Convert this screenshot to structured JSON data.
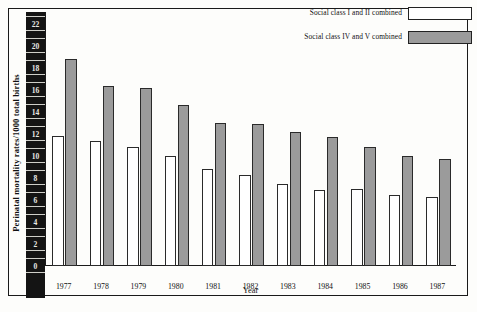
{
  "chart_data": {
    "type": "bar",
    "title": "",
    "xlabel": "Year",
    "ylabel": "Perinatal mortality rates/1000 total births",
    "categories": [
      "1977",
      "1978",
      "1979",
      "1980",
      "1981",
      "1982",
      "1983",
      "1984",
      "1985",
      "1986",
      "1987"
    ],
    "series": [
      {
        "name": "Social class I and II combined",
        "color": "#ffffff",
        "values": [
          11.8,
          11.4,
          10.8,
          10.0,
          8.8,
          8.3,
          7.5,
          6.9,
          7.0,
          6.5,
          6.3
        ]
      },
      {
        "name": "Social class IV and V combined",
        "color": "#9b9b9b",
        "values": [
          18.8,
          16.4,
          16.2,
          14.6,
          13.0,
          12.9,
          12.2,
          11.7,
          10.8,
          10.0,
          9.7
        ]
      }
    ],
    "yticks": [
      0,
      2,
      4,
      6,
      8,
      10,
      12,
      14,
      16,
      18,
      20,
      22
    ],
    "ylim": [
      0,
      23
    ],
    "grid": false,
    "legend_position": "top-right"
  },
  "legend": {
    "entries": [
      {
        "label": "Social class I and II combined",
        "swatch": "white"
      },
      {
        "label": "Social class IV and V combined",
        "swatch": "grey"
      }
    ]
  },
  "axes": {
    "y_title": "Perinatal mortality rates/1000 total births",
    "x_title": "Year"
  }
}
